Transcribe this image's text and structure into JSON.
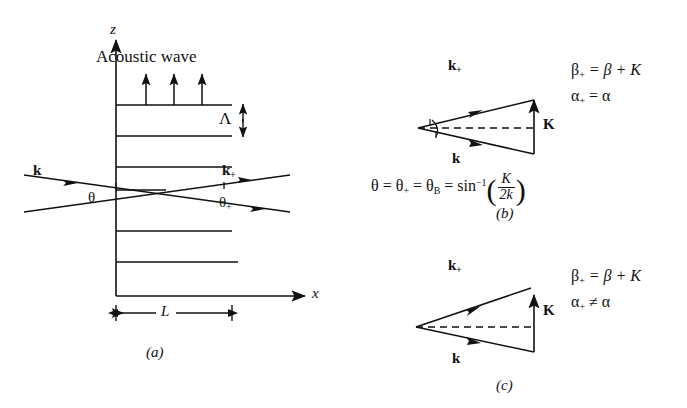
{
  "figure": {
    "background_color": "#ffffff",
    "ink_color": "#111111"
  },
  "panel_a": {
    "caption": "(a)",
    "axis_z": "z",
    "axis_x": "x",
    "acoustic_wave_label": "Acoustic wave",
    "period_label": "Λ",
    "incident_wave_label": "k",
    "diffracted_wave_label": "k",
    "diffracted_wave_sub": "+",
    "angle_in": "θ",
    "angle_out": "θ",
    "angle_out_sub": "+",
    "interaction_length_label": "L",
    "grating_line_count": 7,
    "acoustic_arrow_count": 3
  },
  "panel_b": {
    "caption": "(b)",
    "vector_kplus": "k",
    "vector_kplus_sub": "+",
    "vector_k": "k",
    "vector_K": "K",
    "eq_beta_lhs": "β",
    "eq_beta_lhs_sub": "+",
    "eq_beta_rhs": "= β + K",
    "eq_alpha_lhs": "α",
    "eq_alpha_lhs_sub": "+",
    "eq_alpha_rhs": "= α",
    "closure": "closed triangle (phase matched)"
  },
  "panel_c": {
    "caption": "(c)",
    "vector_kplus": "k",
    "vector_kplus_sub": "+",
    "vector_k": "k",
    "vector_K": "K",
    "eq_beta_lhs": "β",
    "eq_beta_lhs_sub": "+",
    "eq_beta_rhs": "= β + K",
    "eq_alpha_lhs": "α",
    "eq_alpha_lhs_sub": "+",
    "eq_alpha_rhs": "≠ α",
    "closure": "open triangle (phase mismatched)"
  },
  "bragg_equation": {
    "theta": "θ",
    "eq1": "=",
    "theta_plus": "θ",
    "theta_plus_sub": "+",
    "eq2": "=",
    "theta_B": "θ",
    "theta_B_sub": "B",
    "eq3": "=",
    "func": "sin",
    "func_exp": "−1",
    "paren_open": "(",
    "numerator": "K",
    "denominator": "2k",
    "paren_close": ")"
  }
}
